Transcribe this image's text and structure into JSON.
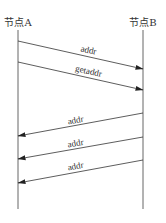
{
  "diagram": {
    "type": "sequence",
    "participants": [
      {
        "id": "A",
        "label": "节点A",
        "x": 18
      },
      {
        "id": "B",
        "label": "节点B",
        "x": 143
      }
    ],
    "messages": [
      {
        "from": "A",
        "to": "B",
        "label": "addr",
        "y1": 41,
        "y2": 69
      },
      {
        "from": "A",
        "to": "B",
        "label": "getaddr",
        "y1": 62,
        "y2": 90
      },
      {
        "from": "B",
        "to": "A",
        "label": "addr",
        "y1": 113,
        "y2": 136
      },
      {
        "from": "B",
        "to": "A",
        "label": "addr",
        "y1": 137,
        "y2": 159
      },
      {
        "from": "B",
        "to": "A",
        "label": "addr",
        "y1": 160,
        "y2": 183
      }
    ]
  },
  "colors": {
    "line": "#333333",
    "background": "#ffffff"
  }
}
